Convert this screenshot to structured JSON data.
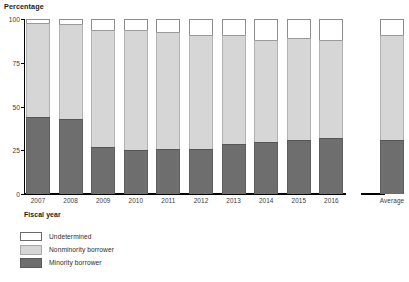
{
  "chart_data": {
    "type": "bar",
    "title": "",
    "ylabel": "Percentage",
    "xlabel": "Fiscal year",
    "ylim": [
      0,
      100
    ],
    "yticks": [
      0,
      25,
      50,
      75,
      100
    ],
    "ytick_labels": [
      "0",
      "25",
      "50",
      "75",
      "100"
    ],
    "grid": false,
    "stacked": true,
    "stack_total": 100,
    "legend_position": "bottom-left",
    "categories": [
      "2007",
      "2008",
      "2009",
      "2010",
      "2011",
      "2012",
      "2013",
      "2014",
      "2015",
      "2016",
      "Average"
    ],
    "separated_category": "Average",
    "series": [
      {
        "name": "Minority borrower",
        "color": "#6e6e6e",
        "values": [
          44,
          43,
          27,
          25,
          25.5,
          26,
          28.5,
          30,
          31,
          32,
          31
        ]
      },
      {
        "name": "Nonminority borrower",
        "color": "#d6d6d6",
        "values": [
          54,
          54,
          67,
          68.5,
          67,
          65,
          62.5,
          58,
          58,
          56,
          60
        ]
      },
      {
        "name": "Undetermined",
        "color": "#ffffff",
        "values": [
          2,
          3,
          6,
          6.5,
          7.5,
          9,
          9,
          12,
          11,
          12,
          9
        ]
      }
    ]
  },
  "legend": {
    "items": [
      {
        "label": "Undetermined",
        "swatch_class": "sw-undetermined"
      },
      {
        "label": "Nonminority borrower",
        "swatch_class": "sw-nonminority"
      },
      {
        "label": "Minority borrower",
        "swatch_class": "sw-minority"
      }
    ]
  }
}
